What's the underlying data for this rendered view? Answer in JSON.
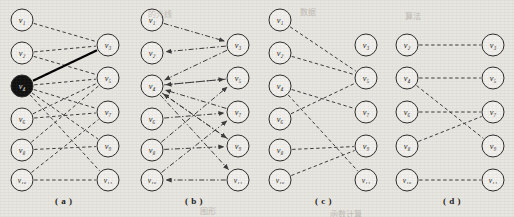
{
  "figure": {
    "background_color": "#e8e6e1",
    "node_fill": "#f2f0ec",
    "node_stroke": "#2b2b2b",
    "highlight_fill": "#111111",
    "edge_color": "#3a3a3a",
    "solid_edge_color": "#000000",
    "node_radius": 11
  },
  "captions": [
    {
      "label": "( a )",
      "x": 55,
      "y": 196
    },
    {
      "label": "( b )",
      "x": 185,
      "y": 196
    },
    {
      "label": "( c )",
      "x": 315,
      "y": 196
    },
    {
      "label": "( d )",
      "x": 443,
      "y": 196
    }
  ],
  "panels": [
    {
      "id": "a",
      "caption": "( a )",
      "origin_x": 0,
      "edge_style": "dashed",
      "directed": false,
      "nodes": [
        {
          "id": "v1",
          "label": "v₁",
          "cx": 22,
          "cy": 20,
          "highlight": false
        },
        {
          "id": "v2",
          "label": "v₂",
          "cx": 22,
          "cy": 53,
          "highlight": false
        },
        {
          "id": "v4",
          "label": "v₄",
          "cx": 22,
          "cy": 86,
          "highlight": true
        },
        {
          "id": "v6",
          "label": "v₆",
          "cx": 22,
          "cy": 119,
          "highlight": false
        },
        {
          "id": "v8",
          "label": "v₈",
          "cx": 22,
          "cy": 150,
          "highlight": false
        },
        {
          "id": "v10",
          "label": "v₁₀",
          "cx": 22,
          "cy": 180,
          "highlight": false
        },
        {
          "id": "v3",
          "label": "v₃",
          "cx": 108,
          "cy": 45,
          "highlight": false
        },
        {
          "id": "v5",
          "label": "v₅",
          "cx": 108,
          "cy": 78,
          "highlight": false
        },
        {
          "id": "v7",
          "label": "v₇",
          "cx": 108,
          "cy": 112,
          "highlight": false
        },
        {
          "id": "v9",
          "label": "v₉",
          "cx": 108,
          "cy": 146,
          "highlight": false
        },
        {
          "id": "v11",
          "label": "v₁₁",
          "cx": 108,
          "cy": 180,
          "highlight": false
        }
      ],
      "edges": [
        {
          "from": "v1",
          "to": "v3",
          "style": "dashed"
        },
        {
          "from": "v2",
          "to": "v3",
          "style": "dashed"
        },
        {
          "from": "v2",
          "to": "v5",
          "style": "dashed"
        },
        {
          "from": "v4",
          "to": "v3",
          "style": "solid-thick"
        },
        {
          "from": "v4",
          "to": "v5",
          "style": "dashed"
        },
        {
          "from": "v4",
          "to": "v7",
          "style": "dashed"
        },
        {
          "from": "v4",
          "to": "v9",
          "style": "dashed"
        },
        {
          "from": "v4",
          "to": "v11",
          "style": "dashed"
        },
        {
          "from": "v6",
          "to": "v5",
          "style": "dashed"
        },
        {
          "from": "v6",
          "to": "v7",
          "style": "dashed"
        },
        {
          "from": "v8",
          "to": "v5",
          "style": "dashed"
        },
        {
          "from": "v8",
          "to": "v9",
          "style": "dashed"
        },
        {
          "from": "v10",
          "to": "v7",
          "style": "dashed"
        },
        {
          "from": "v10",
          "to": "v11",
          "style": "dashed"
        }
      ]
    },
    {
      "id": "b",
      "caption": "( b )",
      "origin_x": 130,
      "edge_style": "dashdot",
      "directed": true,
      "nodes": [
        {
          "id": "v1",
          "label": "v₁",
          "cx": 22,
          "cy": 20,
          "highlight": false
        },
        {
          "id": "v2",
          "label": "v₂",
          "cx": 22,
          "cy": 53,
          "highlight": false
        },
        {
          "id": "v4",
          "label": "v₄",
          "cx": 22,
          "cy": 86,
          "highlight": false
        },
        {
          "id": "v6",
          "label": "v₆",
          "cx": 22,
          "cy": 119,
          "highlight": false
        },
        {
          "id": "v8",
          "label": "v₈",
          "cx": 22,
          "cy": 150,
          "highlight": false
        },
        {
          "id": "v10",
          "label": "v₁₀",
          "cx": 22,
          "cy": 180,
          "highlight": false
        },
        {
          "id": "v3",
          "label": "v₃",
          "cx": 108,
          "cy": 45,
          "highlight": false
        },
        {
          "id": "v5",
          "label": "v₅",
          "cx": 108,
          "cy": 78,
          "highlight": false
        },
        {
          "id": "v7",
          "label": "v₇",
          "cx": 108,
          "cy": 112,
          "highlight": false
        },
        {
          "id": "v9",
          "label": "v₉",
          "cx": 108,
          "cy": 146,
          "highlight": false
        },
        {
          "id": "v11",
          "label": "v₁₁",
          "cx": 108,
          "cy": 180,
          "highlight": false
        }
      ],
      "edges": [
        {
          "from": "v1",
          "to": "v3",
          "style": "dashdot",
          "arrow": true
        },
        {
          "from": "v3",
          "to": "v2",
          "style": "dashdot",
          "arrow": true
        },
        {
          "from": "v3",
          "to": "v4",
          "style": "dashdot",
          "arrow": true
        },
        {
          "from": "v4",
          "to": "v5",
          "style": "dashdot",
          "arrow": true
        },
        {
          "from": "v5",
          "to": "v4",
          "style": "dashdot",
          "arrow": true
        },
        {
          "from": "v6",
          "to": "v7",
          "style": "dashdot",
          "arrow": true
        },
        {
          "from": "v7",
          "to": "v4",
          "style": "dashdot",
          "arrow": true
        },
        {
          "from": "v4",
          "to": "v9",
          "style": "dashdot",
          "arrow": true
        },
        {
          "from": "v8",
          "to": "v9",
          "style": "dashdot",
          "arrow": true
        },
        {
          "from": "v9",
          "to": "v4",
          "style": "dashdot",
          "arrow": true
        },
        {
          "from": "v11",
          "to": "v10",
          "style": "dashdot",
          "arrow": true
        },
        {
          "from": "v4",
          "to": "v11",
          "style": "dashdot",
          "arrow": true
        },
        {
          "from": "v10",
          "to": "v7",
          "style": "dashdot",
          "arrow": true
        },
        {
          "from": "v8",
          "to": "v5",
          "style": "dashdot",
          "arrow": true
        }
      ]
    },
    {
      "id": "c",
      "caption": "( c )",
      "origin_x": 258,
      "edge_style": "dashed",
      "directed": false,
      "nodes": [
        {
          "id": "v1",
          "label": "v₁",
          "cx": 22,
          "cy": 20,
          "highlight": false
        },
        {
          "id": "v2",
          "label": "v₂",
          "cx": 22,
          "cy": 53,
          "highlight": false
        },
        {
          "id": "v4",
          "label": "v₄",
          "cx": 22,
          "cy": 86,
          "highlight": false
        },
        {
          "id": "v6",
          "label": "v₆",
          "cx": 22,
          "cy": 119,
          "highlight": false
        },
        {
          "id": "v8",
          "label": "v₈",
          "cx": 22,
          "cy": 150,
          "highlight": false
        },
        {
          "id": "v10",
          "label": "v₁₀",
          "cx": 22,
          "cy": 180,
          "highlight": false
        },
        {
          "id": "v3",
          "label": "v₃",
          "cx": 108,
          "cy": 45,
          "highlight": false
        },
        {
          "id": "v5",
          "label": "v₅",
          "cx": 108,
          "cy": 78,
          "highlight": false
        },
        {
          "id": "v7",
          "label": "v₇",
          "cx": 108,
          "cy": 112,
          "highlight": false
        },
        {
          "id": "v9",
          "label": "v₉",
          "cx": 108,
          "cy": 146,
          "highlight": false
        },
        {
          "id": "v11",
          "label": "v₁₁",
          "cx": 108,
          "cy": 180,
          "highlight": false
        }
      ],
      "edges": [
        {
          "from": "v1",
          "to": "v5",
          "style": "dashed"
        },
        {
          "from": "v2",
          "to": "v5",
          "style": "dashed"
        },
        {
          "from": "v4",
          "to": "v7",
          "style": "dashed"
        },
        {
          "from": "v4",
          "to": "v11",
          "style": "dashed"
        },
        {
          "from": "v6",
          "to": "v5",
          "style": "dashed"
        },
        {
          "from": "v8",
          "to": "v9",
          "style": "dashed"
        },
        {
          "from": "v10",
          "to": "v9",
          "style": "dashed"
        }
      ]
    },
    {
      "id": "d",
      "caption": "( d )",
      "origin_x": 385,
      "edge_style": "dashed",
      "directed": false,
      "nodes": [
        {
          "id": "v2",
          "label": "v₂",
          "cx": 22,
          "cy": 45,
          "highlight": false
        },
        {
          "id": "v4",
          "label": "v₄",
          "cx": 22,
          "cy": 78,
          "highlight": false
        },
        {
          "id": "v6",
          "label": "v₆",
          "cx": 22,
          "cy": 112,
          "highlight": false
        },
        {
          "id": "v8",
          "label": "v₈",
          "cx": 22,
          "cy": 146,
          "highlight": false
        },
        {
          "id": "v10",
          "label": "v₁₀",
          "cx": 22,
          "cy": 180,
          "highlight": false
        },
        {
          "id": "v3",
          "label": "v₃",
          "cx": 108,
          "cy": 45,
          "highlight": false
        },
        {
          "id": "v5",
          "label": "v₅",
          "cx": 108,
          "cy": 78,
          "highlight": false
        },
        {
          "id": "v7",
          "label": "v₇",
          "cx": 108,
          "cy": 112,
          "highlight": false
        },
        {
          "id": "v9",
          "label": "v₉",
          "cx": 108,
          "cy": 146,
          "highlight": false
        },
        {
          "id": "v11",
          "label": "v₁₁",
          "cx": 108,
          "cy": 180,
          "highlight": false
        }
      ],
      "edges": [
        {
          "from": "v2",
          "to": "v3",
          "style": "dashed"
        },
        {
          "from": "v4",
          "to": "v5",
          "style": "dashed"
        },
        {
          "from": "v4",
          "to": "v9",
          "style": "dashed"
        },
        {
          "from": "v6",
          "to": "v7",
          "style": "dashed"
        },
        {
          "from": "v8",
          "to": "v7",
          "style": "dashed"
        },
        {
          "from": "v10",
          "to": "v11",
          "style": "dashed"
        }
      ]
    }
  ],
  "bleed_text": [
    {
      "text": "的光线",
      "x": 148,
      "y": 8
    },
    {
      "text": "数据",
      "x": 300,
      "y": 6
    },
    {
      "text": "算法",
      "x": 405,
      "y": 10
    },
    {
      "text": "图形",
      "x": 200,
      "y": 205
    },
    {
      "text": "函数计算",
      "x": 330,
      "y": 208
    }
  ]
}
